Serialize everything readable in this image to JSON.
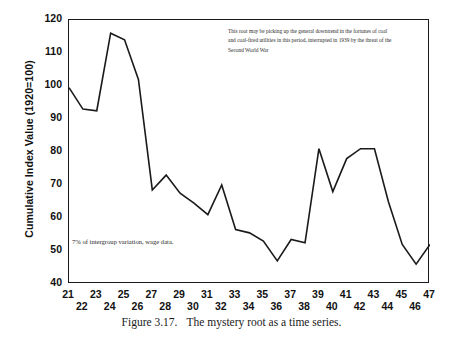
{
  "figure": {
    "caption_label": "Figure 3.17.",
    "caption_text": "The mystery root as a time series."
  },
  "annotations": {
    "top_note": "This root may be picking up the general downtrend in the  fortunes of coal and coal-fired utilities in this period, interrupted in 1939 by the threat of the Second World War",
    "left_note": "7% of intergroup variation, wage data."
  },
  "chart_data": {
    "type": "line",
    "title": "",
    "xlabel": "",
    "ylabel": "Cumulative Index Value (1920=100)",
    "xlim": [
      21,
      47
    ],
    "ylim": [
      40,
      120
    ],
    "yticks": [
      40,
      50,
      60,
      70,
      80,
      90,
      100,
      110,
      120
    ],
    "xticks": [
      21,
      22,
      23,
      24,
      25,
      26,
      27,
      28,
      29,
      30,
      31,
      32,
      33,
      34,
      35,
      36,
      37,
      38,
      39,
      40,
      41,
      42,
      43,
      44,
      45,
      46,
      47
    ],
    "grid": false,
    "legend": false,
    "line_color": "#1a1a1a",
    "x": [
      21,
      22,
      23,
      24,
      25,
      26,
      27,
      28,
      29,
      30,
      31,
      32,
      33,
      34,
      35,
      36,
      37,
      38,
      39,
      40,
      41,
      42,
      43,
      44,
      45,
      46,
      47
    ],
    "values": [
      99.5,
      93.0,
      92.5,
      116.0,
      114.0,
      102.0,
      68.5,
      73.0,
      67.5,
      64.5,
      61.0,
      70.0,
      56.5,
      55.5,
      53.0,
      47.0,
      53.5,
      52.5,
      81.0,
      68.0,
      78.0,
      81.0,
      81.0,
      65.0,
      52.0,
      46.0,
      52.0
    ],
    "series": [
      {
        "name": "Cumulative Index Value",
        "values": [
          99.5,
          93.0,
          92.5,
          116.0,
          114.0,
          102.0,
          68.5,
          73.0,
          67.5,
          64.5,
          61.0,
          70.0,
          56.5,
          55.5,
          53.0,
          47.0,
          53.5,
          52.5,
          81.0,
          68.0,
          78.0,
          81.0,
          81.0,
          65.0,
          52.0,
          46.0,
          52.0
        ]
      }
    ]
  }
}
